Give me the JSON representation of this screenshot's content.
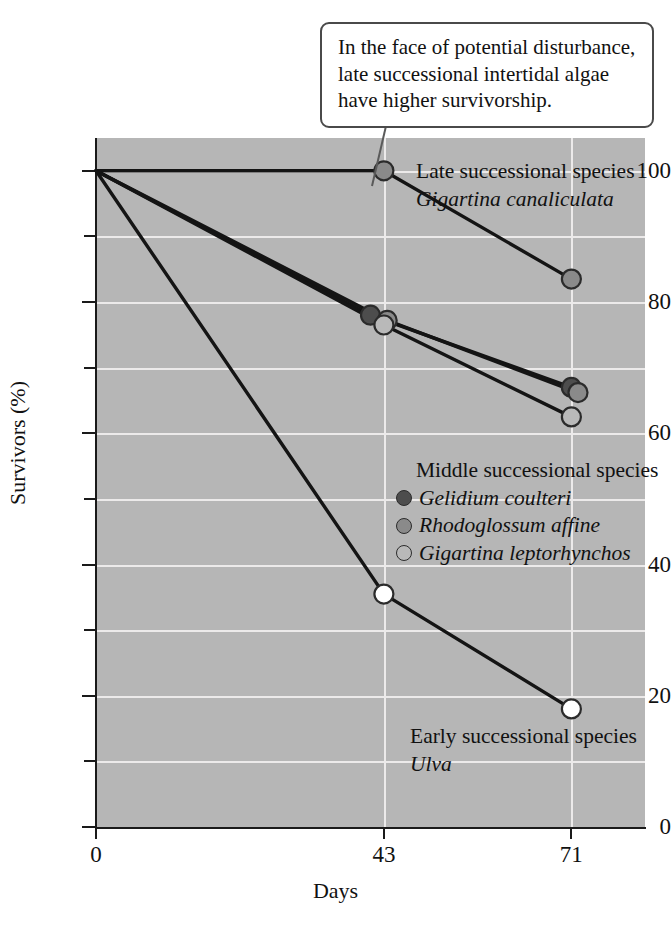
{
  "callout": {
    "text": "In the face of potential disturbance, late successional intertidal algae have higher survivorship."
  },
  "annotations": {
    "late": {
      "title": "Late successional species",
      "species": "Gigartina canaliculata"
    },
    "middle": {
      "title": "Middle successional species"
    },
    "early": {
      "title": "Early successional species",
      "species": "Ulva"
    }
  },
  "colors": {
    "plot_background": "#b6b6b6",
    "gridline": "#eceaea",
    "axis": "#1a1a1a",
    "line": "#141414",
    "marker_dark": "#4d4d4d",
    "marker_medium": "#8a8a8a",
    "marker_light": "#b9b9b9",
    "marker_open": "#ffffff",
    "callout_border": "#4a4a4a"
  },
  "chart_data": {
    "type": "line",
    "title": "",
    "xlabel": "Days",
    "ylabel": "Survivors (%)",
    "x": [
      0,
      43,
      71
    ],
    "xticks": [
      0,
      43,
      71
    ],
    "xticklabels": [
      "0",
      "43",
      "71"
    ],
    "xlim": [
      0,
      82
    ],
    "ylim": [
      0,
      105
    ],
    "yticks": [
      0,
      10,
      20,
      30,
      40,
      50,
      60,
      70,
      80,
      90,
      100
    ],
    "yticklabels_major": [
      "0",
      "20",
      "40",
      "60",
      "80",
      "100"
    ],
    "ymajor": [
      0,
      20,
      40,
      60,
      80,
      100
    ],
    "grid": "horizontal-and-vertical",
    "legend_position": "inside-plot",
    "series": [
      {
        "name": "Gigartina canaliculata",
        "group": "Late successional species",
        "marker": "medium",
        "marker_color": "#8a8a8a",
        "x": [
          0,
          43,
          71
        ],
        "values": [
          100,
          100,
          83.5
        ]
      },
      {
        "name": "Gelidium coulteri",
        "group": "Middle successional species",
        "marker": "dark",
        "marker_color": "#4d4d4d",
        "x": [
          0,
          41,
          71
        ],
        "values": [
          100,
          78,
          67
        ]
      },
      {
        "name": "Rhodoglossum affine",
        "group": "Middle successional species",
        "marker": "medium",
        "marker_color": "#8a8a8a",
        "x": [
          0,
          43.5,
          72
        ],
        "values": [
          100,
          77.2,
          66.2
        ]
      },
      {
        "name": "Gigartina leptorhynchos",
        "group": "Middle successional species",
        "marker": "light",
        "marker_color": "#b9b9b9",
        "x": [
          0,
          43,
          71
        ],
        "values": [
          100,
          76.5,
          62.5
        ]
      },
      {
        "name": "Ulva",
        "group": "Early successional species",
        "marker": "open",
        "marker_color": "#ffffff",
        "x": [
          0,
          43,
          71
        ],
        "values": [
          100,
          35.5,
          18
        ]
      }
    ]
  }
}
